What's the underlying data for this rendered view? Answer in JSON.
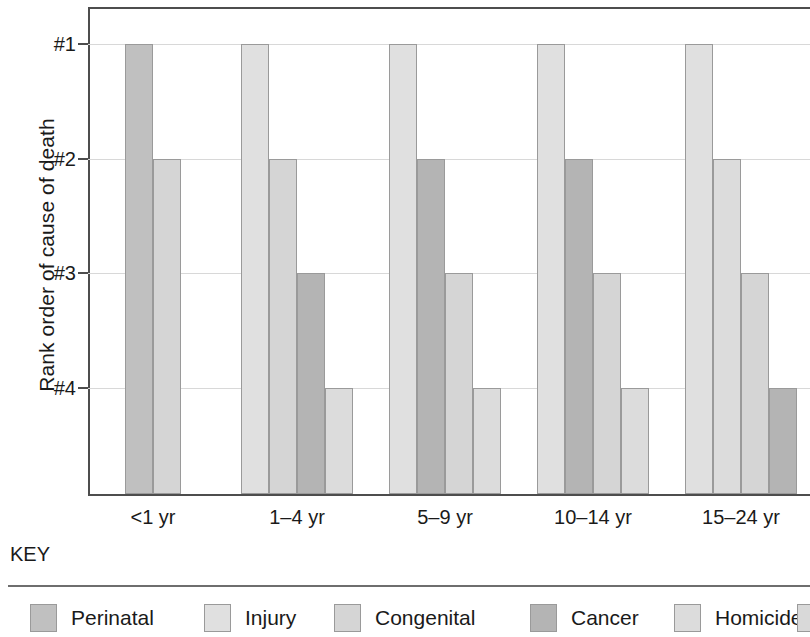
{
  "chart_data": {
    "type": "bar",
    "title": "",
    "subtitle": "",
    "xlabel": "",
    "ylabel": "Rank order of cause of death",
    "categories": [
      "<1 yr",
      "1–4 yr",
      "5–9 yr",
      "10–14 yr",
      "15–24 yr"
    ],
    "y_tick_labels": [
      "#1",
      "#2",
      "#3",
      "#4"
    ],
    "y_tick_values": [
      1,
      2,
      3,
      4
    ],
    "ylim": [
      0.6,
      5.0
    ],
    "y_axis_inverted": true,
    "grid": true,
    "legend_position": "bottom",
    "legend_title": "KEY",
    "series": [
      {
        "name": "Perinatal",
        "color": "#c0c0c0",
        "values": [
          1,
          null,
          null,
          null,
          null
        ]
      },
      {
        "name": "Injury",
        "color": "#e0e0e0",
        "values": [
          null,
          1,
          1,
          1,
          1
        ]
      },
      {
        "name": "Congenital",
        "color": "#d5d5d5",
        "values": [
          2,
          2,
          3,
          3,
          3
        ]
      },
      {
        "name": "Cancer",
        "color": "#b4b4b4",
        "values": [
          null,
          3,
          2,
          2,
          4
        ]
      },
      {
        "name": "Homicide",
        "color": "#dcdcdc",
        "values": [
          null,
          4,
          4,
          4,
          2
        ]
      }
    ],
    "bars": [
      {
        "group": "<1 yr",
        "series": "Perinatal",
        "rank": 1,
        "color": "#c0c0c0",
        "x": 125,
        "w": 28
      },
      {
        "group": "<1 yr",
        "series": "Congenital",
        "rank": 2,
        "color": "#d5d5d5",
        "x": 153,
        "w": 28
      },
      {
        "group": "1–4 yr",
        "series": "Injury",
        "rank": 1,
        "color": "#e0e0e0",
        "x": 241,
        "w": 28
      },
      {
        "group": "1–4 yr",
        "series": "Congenital",
        "rank": 2,
        "color": "#d5d5d5",
        "x": 269,
        "w": 28
      },
      {
        "group": "1–4 yr",
        "series": "Cancer",
        "rank": 3,
        "color": "#b4b4b4",
        "x": 297,
        "w": 28
      },
      {
        "group": "1–4 yr",
        "series": "Homicide",
        "rank": 4,
        "color": "#dcdcdc",
        "x": 325,
        "w": 28
      },
      {
        "group": "5–9 yr",
        "series": "Injury",
        "rank": 1,
        "color": "#e0e0e0",
        "x": 389,
        "w": 28
      },
      {
        "group": "5–9 yr",
        "series": "Cancer",
        "rank": 2,
        "color": "#b4b4b4",
        "x": 417,
        "w": 28
      },
      {
        "group": "5–9 yr",
        "series": "Congenital",
        "rank": 3,
        "color": "#d5d5d5",
        "x": 445,
        "w": 28
      },
      {
        "group": "5–9 yr",
        "series": "Homicide",
        "rank": 4,
        "color": "#dcdcdc",
        "x": 473,
        "w": 28
      },
      {
        "group": "10–14 yr",
        "series": "Injury",
        "rank": 1,
        "color": "#e0e0e0",
        "x": 537,
        "w": 28
      },
      {
        "group": "10–14 yr",
        "series": "Cancer",
        "rank": 2,
        "color": "#b4b4b4",
        "x": 565,
        "w": 28
      },
      {
        "group": "10–14 yr",
        "series": "Congenital",
        "rank": 3,
        "color": "#d5d5d5",
        "x": 593,
        "w": 28
      },
      {
        "group": "10–14 yr",
        "series": "Homicide",
        "rank": 4,
        "color": "#dcdcdc",
        "x": 621,
        "w": 28
      },
      {
        "group": "15–24 yr",
        "series": "Injury",
        "rank": 1,
        "color": "#e0e0e0",
        "x": 685,
        "w": 28
      },
      {
        "group": "15–24 yr",
        "series": "Homicide",
        "rank": 2,
        "color": "#dcdcdc",
        "x": 713,
        "w": 28
      },
      {
        "group": "15–24 yr",
        "series": "Congenital",
        "rank": 3,
        "color": "#d5d5d5",
        "x": 741,
        "w": 28
      },
      {
        "group": "15–24 yr",
        "series": "Cancer",
        "rank": 4,
        "color": "#b4b4b4",
        "x": 769,
        "w": 28
      }
    ],
    "group_label_centers": [
      153,
      297,
      445,
      593,
      741
    ]
  },
  "axis": {
    "y_title": "Rank order of cause of death",
    "y_ticks": [
      {
        "label": "#1",
        "y": 44
      },
      {
        "label": "#2",
        "y": 159
      },
      {
        "label": "#3",
        "y": 273
      },
      {
        "label": "#4",
        "y": 388
      }
    ],
    "x_ticks": [
      {
        "label": "<1 yr",
        "center": 153
      },
      {
        "label": "1–4 yr",
        "center": 297
      },
      {
        "label": "5–9 yr",
        "center": 445
      },
      {
        "label": "10–14 yr",
        "center": 593
      },
      {
        "label": "15–24 yr",
        "center": 741
      }
    ]
  },
  "key": {
    "title": "KEY",
    "items": [
      {
        "label": "Perinatal",
        "color": "#c0c0c0",
        "x": 22
      },
      {
        "label": "Injury",
        "color": "#e0e0e0",
        "x": 196
      },
      {
        "label": "Congenital",
        "color": "#d5d5d5",
        "x": 326
      },
      {
        "label": "Cancer",
        "color": "#b4b4b4",
        "x": 522
      },
      {
        "label": "Homicide",
        "color": "#dcdcdc",
        "x": 666
      }
    ]
  }
}
